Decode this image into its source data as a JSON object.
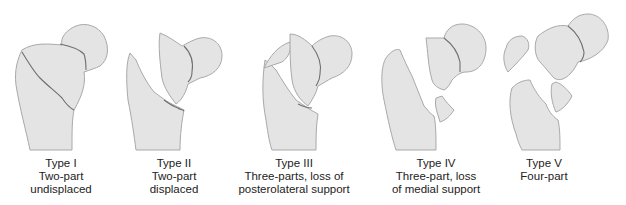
{
  "figure": {
    "colors": {
      "bone_fill": "#e4e4e4",
      "bone_outline": "#a9a9a9",
      "fracture_line": "#6f6f6f",
      "text": "#222222",
      "background": "#ffffff"
    },
    "panels": [
      {
        "type": "Type I",
        "line1": "Two-part",
        "line2": "undisplaced",
        "icon": "femur-two-part-undisplaced-icon"
      },
      {
        "type": "Type II",
        "line1": "Two-part",
        "line2": "displaced",
        "icon": "femur-two-part-displaced-icon"
      },
      {
        "type": "Type III",
        "line1": "Three-parts, loss of",
        "line2": "posterolateral support",
        "icon": "femur-three-part-posterolateral-icon"
      },
      {
        "type": "Type IV",
        "line1": "Three-part, loss",
        "line2": "of medial support",
        "icon": "femur-three-part-medial-icon"
      },
      {
        "type": "Type V",
        "line1": "Four-part",
        "line2": "",
        "icon": "femur-four-part-icon"
      }
    ]
  }
}
